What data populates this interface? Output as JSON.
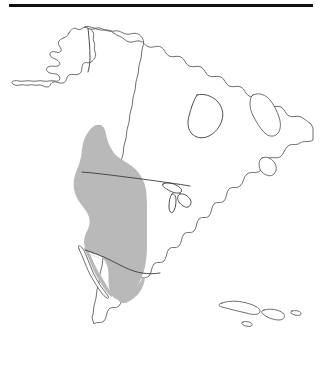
{
  "figure": {
    "kind": "distribution-range-map",
    "region": "North America",
    "background_color": "#ffffff",
    "outline_color": "#4a4a4a",
    "border_color": "#3a3a3a",
    "rule_color": "#111111",
    "range_fill_color": "#b9b9b9",
    "width": 323,
    "height": 391
  },
  "top_rule": {
    "label": "",
    "x": 9,
    "y": 4,
    "width": 304,
    "height": 3
  },
  "landmasses": [
    {
      "name": "alaska",
      "label": ""
    },
    {
      "name": "canada-united-states-mexico-mainland",
      "label": ""
    },
    {
      "name": "baja-california-peninsula",
      "label": ""
    },
    {
      "name": "baffin-island",
      "label": ""
    },
    {
      "name": "newfoundland",
      "label": ""
    },
    {
      "name": "cuba",
      "label": ""
    },
    {
      "name": "hispaniola",
      "label": ""
    },
    {
      "name": "jamaica",
      "label": ""
    },
    {
      "name": "puerto-rico",
      "label": ""
    }
  ],
  "political_borders": [
    {
      "name": "alaska-canada-border",
      "label": ""
    },
    {
      "name": "united-states-canada-border-49th-parallel",
      "label": ""
    },
    {
      "name": "united-states-mexico-border",
      "label": ""
    }
  ],
  "range_overlay": {
    "name": "shaded-distribution-range",
    "label": "",
    "fill": "#b9b9b9",
    "opacity": 1,
    "coverage": "western North America"
  },
  "labels": {
    "title": "",
    "caption": "",
    "legend": ""
  }
}
